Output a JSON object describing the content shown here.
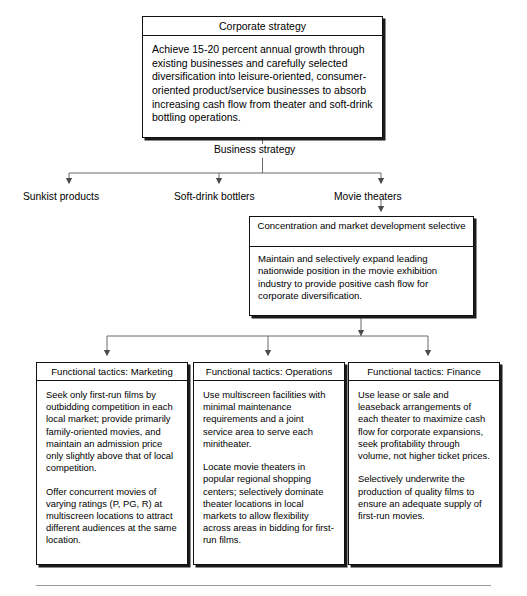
{
  "diagram": {
    "type": "hierarchy-flowchart",
    "accent_color": "#000000",
    "line_color": "#5a5a5a",
    "background": "#ffffff"
  },
  "corporate_box": {
    "title": "Corporate strategy",
    "body": "Achieve 15-20 percent annual growth through existing businesses and carefully selected diversification into leisure-oriented, consumer-oriented product/service businesses to absorb increasing cash flow from theater and soft-drink bottling operations."
  },
  "business_strategy": {
    "label": "Business strategy",
    "branches": [
      {
        "label": "Sunkist products"
      },
      {
        "label": "Soft-drink bottlers"
      },
      {
        "label": "Movie theaters"
      }
    ]
  },
  "concentration_box": {
    "title": "Concentration and market development selective",
    "body": "Maintain and selectively expand leading nationwide position in the movie exhibition industry to provide positive cash flow for corporate diversification."
  },
  "tactics": [
    {
      "title": "Functional tactics: Marketing",
      "paragraphs": [
        "Seek only first-run films by outbidding competition in each local market; provide primarily family-oriented movies, and maintain an admission price only slightly above that of local competition.",
        "Offer concurrent movies of varying ratings (P, PG, R) at multiscreen locations to attract different audiences at the same location."
      ]
    },
    {
      "title": "Functional tactics: Operations",
      "paragraphs": [
        "Use multiscreen facilities with minimal maintenance requirements and a joint service area to serve each minitheater.",
        "Locate movie theaters in popular regional shopping centers; selectively dominate theater locations in local markets to allow flexibility across areas in bidding for first-run films."
      ]
    },
    {
      "title": "Functional tactics: Finance",
      "paragraphs": [
        "Use lease or sale and leaseback arrangements of each theater to maximize cash flow for corporate expansions, seek profitability through volume, not higher ticket prices.",
        "Selectively underwrite the production of quality films to ensure an adequate supply of first-run movies."
      ]
    }
  ]
}
